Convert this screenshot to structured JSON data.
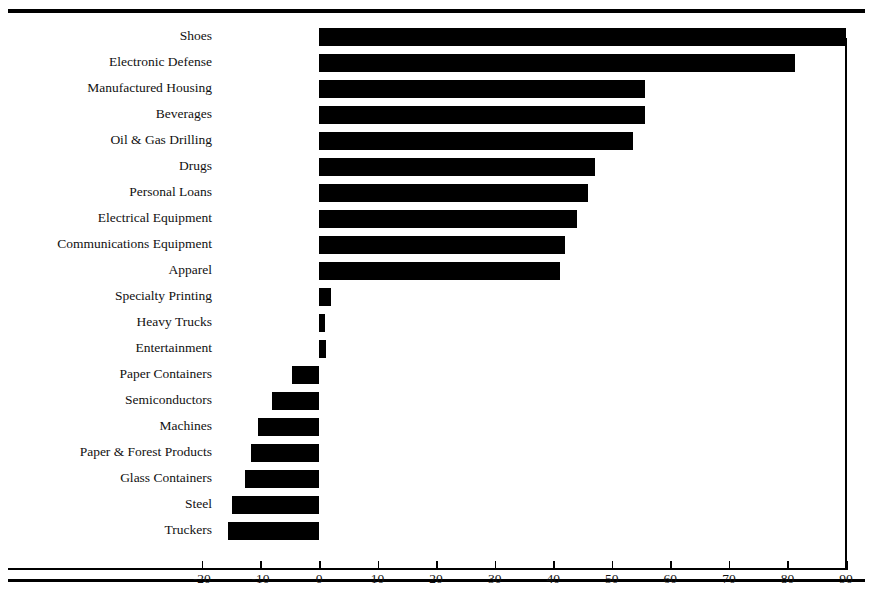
{
  "figure": {
    "width": 873,
    "height": 590,
    "background_color": "#ffffff",
    "bar_color": "#000000",
    "rule_color": "#000000"
  },
  "chart_data": {
    "type": "bar",
    "orientation": "horizontal",
    "title": "",
    "subtitle": "",
    "xlabel": "",
    "ylabel": "",
    "xlim": [
      -25,
      90
    ],
    "xticks": [
      -20,
      -10,
      0,
      10,
      20,
      30,
      40,
      50,
      60,
      70,
      80,
      90
    ],
    "xticklabels": [
      "-20",
      "-10",
      "0",
      "10",
      "20",
      "30",
      "40",
      "50",
      "60",
      "70",
      "80",
      "90"
    ],
    "grid": false,
    "legend": false,
    "zero_line": 0,
    "categories": [
      "Shoes",
      "Electronic Defense",
      "Manufactured Housing",
      "Beverages",
      "Oil & Gas Drilling",
      "Drugs",
      "Personal Loans",
      "Electrical Equipment",
      "Communications Equipment",
      "Apparel",
      "Specialty Printing",
      "Heavy Trucks",
      "Entertainment",
      "Paper Containers",
      "Semiconductors",
      "Machines",
      "Paper & Forest Products",
      "Glass Containers",
      "Steel",
      "Truckers"
    ],
    "values": [
      90.0,
      81.3,
      55.7,
      55.7,
      53.6,
      47.1,
      45.9,
      44.1,
      42.0,
      41.2,
      2.0,
      1.0,
      1.2,
      -4.6,
      -8.0,
      -10.4,
      -11.6,
      -12.6,
      -14.9,
      -15.5
    ]
  }
}
